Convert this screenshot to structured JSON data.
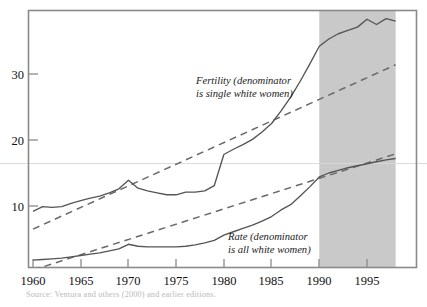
{
  "chart_data": {
    "type": "line",
    "title": "",
    "xlabel": "",
    "ylabel": "",
    "xlim": [
      1960,
      1998
    ],
    "ylim": [
      0,
      39
    ],
    "grid": false,
    "legend_position": "inline-annotations",
    "xticks": [
      1960,
      1965,
      1970,
      1975,
      1980,
      1985,
      1990,
      1995
    ],
    "xtick_labels": [
      "1960",
      "1965",
      "1970",
      "1975",
      "1980",
      "1985",
      "1990",
      "1995"
    ],
    "yticks": [
      10,
      20,
      30
    ],
    "ytick_labels": [
      "10",
      "20",
      "30"
    ],
    "shaded_region": {
      "x0": 1990,
      "x1": 1998,
      "color": "#c9c9c9",
      "label": ""
    },
    "series": [
      {
        "name": "Fertility (denominator is single white women)",
        "style": "solid",
        "x": [
          1960,
          1961,
          1962,
          1963,
          1964,
          1965,
          1966,
          1967,
          1968,
          1969,
          1970,
          1971,
          1972,
          1973,
          1974,
          1975,
          1976,
          1977,
          1978,
          1979,
          1980,
          1981,
          1982,
          1983,
          1984,
          1985,
          1986,
          1987,
          1988,
          1989,
          1990,
          1991,
          1992,
          1993,
          1994,
          1995,
          1996,
          1997,
          1998
        ],
        "values": [
          9.2,
          9.9,
          9.8,
          9.9,
          10.4,
          10.8,
          11.2,
          11.5,
          12.0,
          12.6,
          13.9,
          12.7,
          12.3,
          12.0,
          11.7,
          11.7,
          12.1,
          12.1,
          12.3,
          13.1,
          17.8,
          18.6,
          19.3,
          20.1,
          21.2,
          22.5,
          24.4,
          26.5,
          28.9,
          31.5,
          34.2,
          35.3,
          36.1,
          36.6,
          37.1,
          38.3,
          37.5,
          38.4,
          38.0
        ]
      },
      {
        "name": "Rate (denominator is all white women)",
        "style": "solid",
        "x": [
          1960,
          1961,
          1962,
          1963,
          1964,
          1965,
          1966,
          1967,
          1968,
          1969,
          1970,
          1971,
          1972,
          1973,
          1974,
          1975,
          1976,
          1977,
          1978,
          1979,
          1980,
          1981,
          1982,
          1983,
          1984,
          1985,
          1986,
          1987,
          1988,
          1989,
          1990,
          1991,
          1992,
          1993,
          1994,
          1995,
          1996,
          1997,
          1998
        ],
        "values": [
          1.8,
          1.9,
          2.0,
          2.1,
          2.3,
          2.5,
          2.7,
          2.9,
          3.2,
          3.5,
          4.2,
          3.9,
          3.8,
          3.8,
          3.8,
          3.8,
          3.9,
          4.1,
          4.4,
          4.8,
          5.6,
          6.1,
          6.6,
          7.1,
          7.7,
          8.4,
          9.4,
          10.2,
          11.5,
          12.9,
          14.4,
          15.0,
          15.4,
          15.8,
          16.1,
          16.4,
          16.7,
          17.0,
          17.2
        ]
      },
      {
        "name": "Fertility trend",
        "style": "dashed",
        "x": [
          1960,
          1998
        ],
        "values": [
          6.5,
          31.4
        ]
      },
      {
        "name": "Rate trend",
        "style": "dashed",
        "x": [
          1960,
          1998
        ],
        "values": [
          0.3,
          17.9
        ]
      }
    ],
    "annotations": [
      {
        "name": "fertility-label",
        "line1": "Fertility (denominator",
        "line2": "is single white women)",
        "x": 1979.5,
        "y": 28.5
      },
      {
        "name": "rate-label",
        "line1": "Rate (denominator",
        "line2": "is all white women)",
        "x": 1983.0,
        "y": 5.6
      }
    ]
  },
  "axes": {
    "y_tick_labels": [
      "30",
      "20",
      "10"
    ],
    "x_tick_labels": [
      "1960",
      "1965",
      "1970",
      "1975",
      "1980",
      "1985",
      "1990",
      "1995"
    ]
  },
  "annotations": {
    "fertility": {
      "line1": "Fertility (denominator",
      "line2": "is single white women)"
    },
    "rate": {
      "line1": "Rate (denominator",
      "line2": "is all white women)"
    }
  },
  "caption": {
    "text": "Source: Ventura and others (2000) and earlier editions."
  },
  "colors": {
    "line": "#555555",
    "dashed": "#6a6a6a",
    "frame": "#8a8a8a",
    "shade": "#c9c9c9",
    "text": "#1a1a1a",
    "caption": "#c4c4c4"
  }
}
